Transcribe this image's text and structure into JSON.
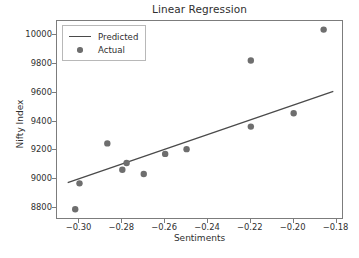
{
  "chart_data": {
    "type": "scatter",
    "title": "Linear Regression",
    "xlabel": "Sentiments",
    "ylabel": "Nifty Index",
    "xlim": [
      -0.3105,
      -0.1765
    ],
    "ylim": [
      8715,
      10100
    ],
    "grid": false,
    "legend_position": "upper left",
    "series": [
      {
        "name": "Predicted",
        "type": "line",
        "color": "#4a4a4a",
        "x": [
          -0.3055,
          -0.1815
        ],
        "values": [
          8975,
          9610
        ]
      },
      {
        "name": "Actual",
        "type": "scatter",
        "color": "#6e6e6e",
        "x": [
          -0.302,
          -0.3,
          -0.287,
          -0.28,
          -0.278,
          -0.27,
          -0.26,
          -0.25,
          -0.22,
          -0.22,
          -0.2,
          -0.186
        ],
        "values": [
          8790,
          8970,
          9248,
          9065,
          9112,
          9035,
          9175,
          9208,
          9365,
          9825,
          9458,
          10040
        ]
      }
    ],
    "xticks": [
      -0.3,
      -0.28,
      -0.26,
      -0.24,
      -0.22,
      -0.2,
      -0.18
    ],
    "xtick_labels": [
      "−0.30",
      "−0.28",
      "−0.26",
      "−0.24",
      "−0.22",
      "−0.20",
      "−0.18"
    ],
    "yticks": [
      8800,
      9000,
      9200,
      9400,
      9600,
      9800,
      10000
    ],
    "ytick_labels": [
      "8800",
      "9000",
      "9200",
      "9400",
      "9600",
      "9800",
      "10000"
    ],
    "legend": [
      {
        "label": "Predicted",
        "marker": "line"
      },
      {
        "label": "Actual",
        "marker": "dot"
      }
    ]
  }
}
